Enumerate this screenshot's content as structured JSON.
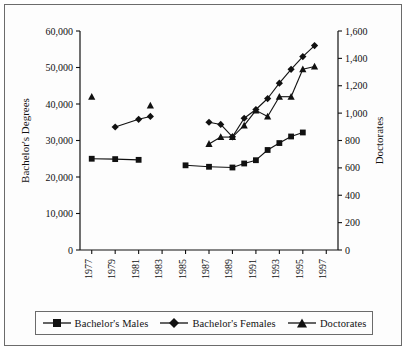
{
  "chart_data": {
    "type": "line",
    "title": "",
    "subtitle": "",
    "xlabel": "",
    "ylabel": "Bachelor's Degrees",
    "y2label": "Doctorates",
    "xlim": [
      1976,
      1998
    ],
    "ylim": [
      0,
      60000
    ],
    "y2lim": [
      0,
      1600
    ],
    "grid": false,
    "legend_position": "bottom",
    "x_tick_labels": [
      "1977",
      "1979",
      "1981",
      "1983",
      "1985",
      "1987",
      "1989",
      "1991",
      "1993",
      "1995",
      "1997"
    ],
    "x_ticks": [
      1977,
      1979,
      1981,
      1983,
      1985,
      1987,
      1989,
      1991,
      1993,
      1995,
      1997
    ],
    "y_tick_labels": [
      "0",
      "10,000",
      "20,000",
      "30,000",
      "40,000",
      "50,000",
      "60,000"
    ],
    "y_ticks": [
      0,
      10000,
      20000,
      30000,
      40000,
      50000,
      60000
    ],
    "y2_tick_labels": [
      "0",
      "200",
      "400",
      "600",
      "800",
      "1,000",
      "1,200",
      "1,400",
      "1,600"
    ],
    "y2_ticks": [
      0,
      200,
      400,
      600,
      800,
      1000,
      1200,
      1400,
      1600
    ],
    "series": [
      {
        "name": "Bachelor's Males",
        "marker": "square",
        "axis": "left",
        "x": [
          1977,
          1979,
          1981,
          1985,
          1987,
          1989,
          1990,
          1991,
          1992,
          1993,
          1994,
          1995
        ],
        "values": [
          25000,
          24900,
          24700,
          23200,
          22800,
          22600,
          23700,
          24600,
          27400,
          29300,
          31100,
          32200
        ]
      },
      {
        "name": "Bachelor's Females",
        "marker": "diamond",
        "axis": "left",
        "x": [
          1979,
          1981,
          1982,
          1987,
          1988,
          1989,
          1990,
          1991,
          1992,
          1993,
          1994,
          1995,
          1996
        ],
        "values": [
          33700,
          35800,
          36600,
          35000,
          34400,
          31000,
          36100,
          38500,
          41500,
          45700,
          49500,
          53000,
          56000
        ]
      },
      {
        "name": "Doctorates",
        "marker": "triangle",
        "axis": "right",
        "x": [
          1977,
          1982,
          1987,
          1988,
          1989,
          1990,
          1991,
          1992,
          1993,
          1994,
          1995,
          1996
        ],
        "values": [
          1120,
          1055,
          775,
          825,
          825,
          910,
          1020,
          975,
          1120,
          1120,
          1320,
          1340
        ]
      }
    ]
  },
  "axes": {
    "left_title": "Bachelor's Degrees",
    "right_title": "Doctorates"
  },
  "legend": {
    "items": [
      {
        "label": "Bachelor's Males",
        "marker": "square"
      },
      {
        "label": "Bachelor's Females",
        "marker": "diamond"
      },
      {
        "label": "Doctorates",
        "marker": "triangle"
      }
    ]
  },
  "colors": {
    "ink": "#111111",
    "frame": "#6b6b6b",
    "background": "#fdfdfd"
  }
}
